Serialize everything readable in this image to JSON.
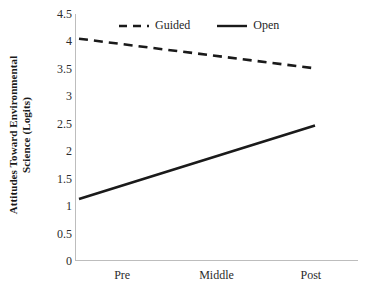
{
  "chart_data": {
    "type": "line",
    "title": "",
    "subtitle": "",
    "xlabel": "",
    "ylabel": "Attitudes Toward Environmental Science (Logits)",
    "ylabel_line1": "Attitudes Toward Environmental",
    "ylabel_line2": "Science (Logits)",
    "categories": [
      "Pre",
      "Middle",
      "Post"
    ],
    "series": [
      {
        "name": "Guided",
        "style": "dashed",
        "color": "#1a1a1a",
        "values": [
          4.05,
          3.78,
          3.51
        ]
      },
      {
        "name": "Open",
        "style": "solid",
        "color": "#1a1a1a",
        "values": [
          1.13,
          1.8,
          2.47
        ]
      }
    ],
    "ylim": [
      0,
      4.5
    ],
    "ytick_values": [
      0,
      0.5,
      1,
      1.5,
      2,
      2.5,
      3,
      3.5,
      4,
      4.5
    ],
    "ytick_labels": [
      "0",
      "0.5",
      "1",
      "1.5",
      "2",
      "2.5",
      "3",
      "3.5",
      "4",
      "4.5"
    ],
    "grid": false,
    "legend_position": "top-center",
    "legend_entries": [
      "Guided",
      "Open"
    ],
    "axis_color": "#bdbdbd",
    "background": "#ffffff"
  }
}
